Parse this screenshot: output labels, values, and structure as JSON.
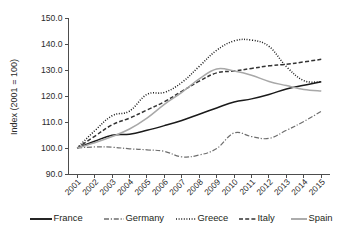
{
  "chart_data": {
    "type": "line",
    "title": "",
    "xlabel": "",
    "ylabel": "Index (2001 = 100)",
    "ylim": [
      90.0,
      150.0
    ],
    "yticks": [
      "90.0",
      "100.0",
      "110.0",
      "120.0",
      "130.0",
      "140.0",
      "150.0"
    ],
    "ytick_values": [
      90.0,
      100.0,
      110.0,
      120.0,
      130.0,
      140.0,
      150.0
    ],
    "grid": false,
    "legend_position": "bottom",
    "categories": [
      "2001",
      "2002",
      "2003",
      "2004",
      "2005",
      "2006",
      "2007",
      "2008",
      "2009",
      "2010",
      "2011",
      "2012",
      "2013",
      "2014",
      "2015"
    ],
    "series": [
      {
        "name": "France",
        "style": "solid",
        "color": "#1a1a1a",
        "values": [
          100.0,
          102.6,
          104.9,
          105.3,
          106.8,
          108.6,
          110.6,
          113.0,
          115.4,
          117.7,
          118.9,
          120.6,
          122.7,
          124.1,
          125.5
        ]
      },
      {
        "name": "Germany",
        "style": "dash-dot",
        "color": "#6e6e6e",
        "values": [
          100.0,
          100.4,
          100.3,
          99.7,
          99.3,
          98.7,
          96.6,
          97.3,
          99.8,
          105.8,
          104.4,
          103.7,
          106.8,
          110.2,
          114.1
        ]
      },
      {
        "name": "Greece",
        "style": "dotted",
        "color": "#1a1a1a",
        "values": [
          100.0,
          106.6,
          112.4,
          114.2,
          120.6,
          121.4,
          125.2,
          131.4,
          137.6,
          141.2,
          141.5,
          139.1,
          131.3,
          125.9,
          125.5
        ]
      },
      {
        "name": "Italy",
        "style": "dashed",
        "color": "#333333",
        "values": [
          100.0,
          104.5,
          108.9,
          111.5,
          114.6,
          117.8,
          121.8,
          125.7,
          128.9,
          129.6,
          130.6,
          131.6,
          132.2,
          133.1,
          134.1
        ]
      },
      {
        "name": "Spain",
        "style": "solid",
        "color": "#a8a8a8",
        "values": [
          100.0,
          102.0,
          104.4,
          107.3,
          111.5,
          116.8,
          121.4,
          126.6,
          130.4,
          129.6,
          128.0,
          125.6,
          124.0,
          122.5,
          121.9
        ]
      }
    ]
  },
  "legend": {
    "items": [
      {
        "label": "France"
      },
      {
        "label": "Germany"
      },
      {
        "label": "Greece"
      },
      {
        "label": "Italy"
      },
      {
        "label": "Spain"
      }
    ]
  }
}
